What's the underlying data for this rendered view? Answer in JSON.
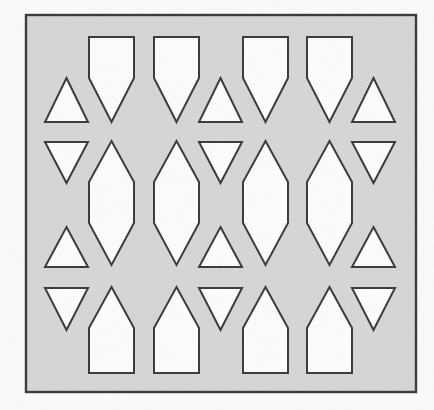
{
  "image": {
    "width": 434,
    "height": 410,
    "background": "#fbfbfb"
  },
  "panel": {
    "x": 26,
    "y": 15,
    "width": 390,
    "height": 377,
    "fill": "#d6d6d6",
    "stroke": "#383838",
    "stroke_width": 2.4
  },
  "cutout_style": {
    "fill": "#fdfdfd",
    "stroke": "#383838",
    "stroke_width": 2
  },
  "cutouts": [
    {
      "kind": "shield-top-1",
      "points": "89,37 134,37 134,78 111.5,122 89,78"
    },
    {
      "kind": "shield-top-2",
      "points": "154,37 199,37 199,78 176.5,122 154,78"
    },
    {
      "kind": "shield-top-3",
      "points": "243,37 288,37 288,78 265.5,122 243,78"
    },
    {
      "kind": "shield-top-4",
      "points": "307,37 352,37 352,78 329.5,122 307,78"
    },
    {
      "kind": "triangle-up-row1-left",
      "points": "66.5,78 88,122 45,122"
    },
    {
      "kind": "triangle-up-row1-center",
      "points": "220.5,78 242,122 199,122"
    },
    {
      "kind": "triangle-up-row1-right",
      "points": "373.5,78 395,122 352,122"
    },
    {
      "kind": "triangle-down-row2-left",
      "points": "45,142 88,142 66.5,183"
    },
    {
      "kind": "triangle-down-row2-center",
      "points": "199,142 242,142 220.5,183"
    },
    {
      "kind": "triangle-down-row2-right",
      "points": "352,142 395,142 373.5,183"
    },
    {
      "kind": "hexagon-mid-1",
      "points": "111.5,141 134,182 134,223 111.5,265 89,223 89,182"
    },
    {
      "kind": "hexagon-mid-2",
      "points": "176.5,141 199,182 199,223 176.5,265 154,223 154,182"
    },
    {
      "kind": "hexagon-mid-3",
      "points": "265.5,141 288,182 288,223 265.5,265 243,223 243,182"
    },
    {
      "kind": "hexagon-mid-4",
      "points": "329.5,141 352,182 352,223 329.5,265 307,223 307,182"
    },
    {
      "kind": "triangle-up-row3-left",
      "points": "66.5,227 88,267 45,267"
    },
    {
      "kind": "triangle-up-row3-center",
      "points": "220.5,227 242,267 199,267"
    },
    {
      "kind": "triangle-up-row3-right",
      "points": "373.5,227 395,267 352,267"
    },
    {
      "kind": "triangle-down-row4-left",
      "points": "45,288 88,288 66.5,330"
    },
    {
      "kind": "triangle-down-row4-center",
      "points": "199,288 242,288 220.5,330"
    },
    {
      "kind": "triangle-down-row4-right",
      "points": "352,288 395,288 373.5,330"
    },
    {
      "kind": "house-bottom-1",
      "points": "111.5,287 134,328 134,373 89,373 89,328"
    },
    {
      "kind": "house-bottom-2",
      "points": "176.5,287 199,328 199,373 154,373 154,328"
    },
    {
      "kind": "house-bottom-3",
      "points": "265.5,287 288,328 288,373 243,373 243,328"
    },
    {
      "kind": "house-bottom-4",
      "points": "329.5,287 352,328 352,373 307,373 307,328"
    }
  ]
}
